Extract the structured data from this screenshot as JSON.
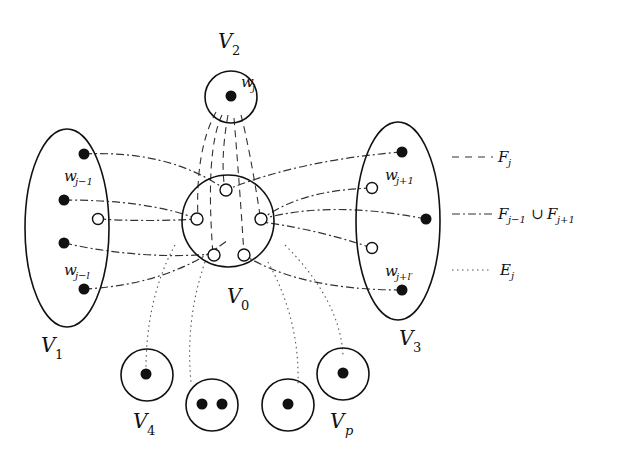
{
  "diagram": {
    "title": "",
    "sets": {
      "V0": {
        "label": "V",
        "sub": "0"
      },
      "V1": {
        "label": "V",
        "sub": "1"
      },
      "V2": {
        "label": "V",
        "sub": "2"
      },
      "V3": {
        "label": "V",
        "sub": "3"
      },
      "V4": {
        "label": "V",
        "sub": "4"
      },
      "Vp": {
        "label": "V",
        "sub": "p"
      }
    },
    "vertices": {
      "wj": {
        "label": "w",
        "sub": "j"
      },
      "wj_minus_1": {
        "label": "w",
        "sub": "j−1"
      },
      "wj_minus_l": {
        "label": "w",
        "sub": "j−l"
      },
      "wj_plus_1": {
        "label": "w",
        "sub": "j+1"
      },
      "wj_plus_lp": {
        "label": "w",
        "sub": "j+l′"
      }
    },
    "legend": [
      {
        "style": "dashed",
        "label": "F",
        "sub": "j",
        "rest": ""
      },
      {
        "style": "dash-dot",
        "label": "F",
        "sub": "j−1",
        "rest": " ∪ F",
        "sub2": "j+1"
      },
      {
        "style": "dotted",
        "label": "E",
        "sub": "j",
        "rest": ""
      }
    ],
    "colors": {
      "stroke": "#111111",
      "background": "#ffffff"
    }
  }
}
